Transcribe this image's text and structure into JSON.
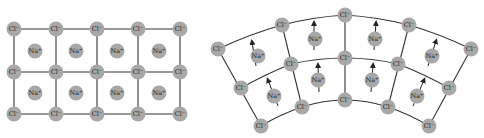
{
  "diagrams": [
    {
      "id": "flat",
      "description": "flat NaCl lattice",
      "anion_label": "Cl⁻",
      "cation_label": "Na⁺",
      "anions": [
        [
          14,
          29
        ],
        [
          56,
          29
        ],
        [
          97,
          29
        ],
        [
          138,
          29
        ],
        [
          180,
          29
        ],
        [
          14,
          72
        ],
        [
          56,
          72
        ],
        [
          97,
          72
        ],
        [
          138,
          72
        ],
        [
          180,
          72
        ],
        [
          14,
          114
        ],
        [
          56,
          114
        ],
        [
          97,
          114
        ],
        [
          138,
          114
        ],
        [
          180,
          114
        ]
      ],
      "cations": [
        [
          35,
          51
        ],
        [
          76,
          51
        ],
        [
          117,
          51
        ],
        [
          159,
          51
        ],
        [
          35,
          93
        ],
        [
          76,
          93
        ],
        [
          117,
          93
        ],
        [
          159,
          93
        ]
      ]
    },
    {
      "id": "bent",
      "description": "bent NaCl lattice with dipole arrows",
      "anion_label": "Cl⁻",
      "cation_label": "Na⁺",
      "anions": [
        [
          218,
          49
        ],
        [
          282,
          25
        ],
        [
          345,
          15
        ],
        [
          409,
          25
        ],
        [
          471,
          49
        ],
        [
          241,
          88
        ],
        [
          291,
          64
        ],
        [
          345,
          58
        ],
        [
          398,
          64
        ],
        [
          449,
          88
        ],
        [
          261,
          126
        ],
        [
          302,
          107
        ],
        [
          345,
          100
        ],
        [
          388,
          107
        ],
        [
          429,
          126
        ]
      ],
      "cations": [
        [
          258,
          56
        ],
        [
          315,
          39
        ],
        [
          375,
          39
        ],
        [
          432,
          56
        ],
        [
          274,
          96
        ],
        [
          318,
          80
        ],
        [
          372,
          80
        ],
        [
          417,
          96
        ]
      ]
    }
  ],
  "colors": {
    "atom": "#a8a8a8",
    "bond": "#333333",
    "text": "#222222"
  }
}
